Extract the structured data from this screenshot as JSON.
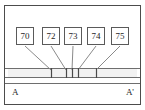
{
  "figure": {
    "type": "cross-section-diagram",
    "frame": {
      "x": 4,
      "y": 5,
      "width": 137,
      "height": 100,
      "stroke_color": "#4c4c4c"
    },
    "layer_band": {
      "name": "marker-bed",
      "x": 8,
      "y": 68,
      "width": 129,
      "height": 9,
      "fill_color": "#f2f2f2",
      "stroke_color": "#6e6e6e"
    },
    "callouts": [
      {
        "label": "70",
        "box_cx": 25,
        "box_cy": 36,
        "tick_x": 51
      },
      {
        "label": "72",
        "box_cx": 51,
        "box_cy": 36,
        "tick_x": 66
      },
      {
        "label": "73",
        "box_cx": 73,
        "box_cy": 36,
        "tick_x": 72
      },
      {
        "label": "74",
        "box_cx": 96,
        "box_cy": 36,
        "tick_x": 78
      },
      {
        "label": "75",
        "box_cx": 120,
        "box_cy": 36,
        "tick_x": 96
      }
    ],
    "endpoints": {
      "left_label": "A",
      "right_label": "A'",
      "left_x": 12,
      "right_x": 133,
      "y": 92
    },
    "colors": {
      "frame": "#4c4c4c",
      "band_stroke": "#6e6e6e",
      "band_fill": "#f2f2f2",
      "leader": "#8a8a8a",
      "tick": "#4a4a4a",
      "text": "#262626",
      "background": "#ffffff"
    }
  }
}
